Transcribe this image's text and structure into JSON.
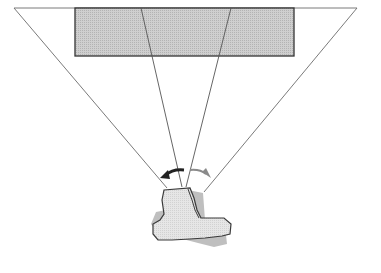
{
  "diagram": {
    "colors": {
      "background": "#ffffff",
      "panel_fill": "#c8c8c8",
      "panel_stroke": "#333333",
      "lines": "#6b6b6b",
      "figure_fill": "#e2e2e2",
      "figure_back_fill": "#bdbdbd",
      "figure_stroke": "#3a3a3a",
      "arrow_left": "#222222",
      "arrow_right": "#8a8a8a"
    },
    "elements": {
      "panel": "display-panel",
      "outer_view_cone": "wide-field-of-view",
      "inner_view_cone": "narrow-field-of-view",
      "figure": "person-top-view",
      "rotation_arrows": "head-rotation"
    }
  }
}
